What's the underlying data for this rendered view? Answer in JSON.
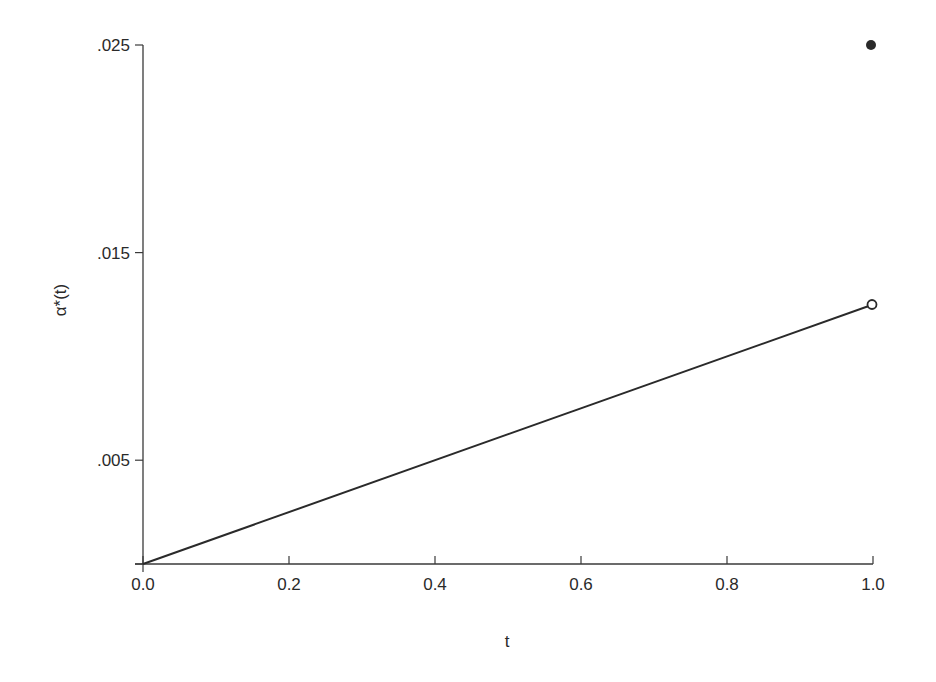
{
  "chart_data": {
    "type": "line",
    "title": "",
    "xlabel": "t",
    "ylabel": "α*(t)",
    "xlim": [
      0.0,
      1.0
    ],
    "ylim": [
      0.0,
      0.025
    ],
    "grid": false,
    "legend": null,
    "x_ticks": [
      0.0,
      0.2,
      0.4,
      0.6,
      0.8,
      1.0
    ],
    "x_tick_labels": [
      "0.0",
      "0.2",
      "0.4",
      "0.6",
      "0.8",
      "1.0"
    ],
    "y_ticks": [
      0.0,
      0.005,
      0.015,
      0.025
    ],
    "y_tick_labels": [
      "",
      ".005",
      ".015",
      ".025"
    ],
    "series": [
      {
        "name": "alpha_star",
        "style": "solid line",
        "x": [
          0.0,
          1.0
        ],
        "y": [
          0.0,
          0.0125
        ]
      }
    ],
    "annotations": [
      {
        "type": "open-circle",
        "x": 1.0,
        "y": 0.0125,
        "meaning": "line endpoint excluded"
      },
      {
        "type": "filled-circle",
        "x": 1.0,
        "y": 0.025,
        "meaning": "value at t = 1"
      }
    ]
  },
  "layout": {
    "plot_left": 143,
    "plot_right": 873,
    "plot_top": 45,
    "plot_bottom": 564,
    "axis_color": "#3a3a3a",
    "line_color": "#2a2a2a"
  }
}
